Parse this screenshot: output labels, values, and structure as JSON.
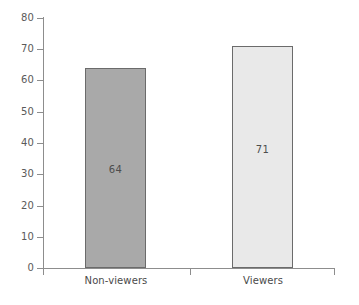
{
  "chart_data": {
    "type": "bar",
    "title": "",
    "subtitle": "",
    "xlabel": "",
    "ylabel": "",
    "categories": [
      "Non-viewers",
      "Viewers"
    ],
    "values": [
      64,
      71
    ],
    "value_labels": [
      "64",
      "71"
    ],
    "series": [
      {
        "name": "",
        "values": [
          64,
          71
        ]
      }
    ],
    "ylim": [
      0,
      80
    ],
    "y_ticks": [
      0,
      10,
      20,
      30,
      40,
      50,
      60,
      70,
      80
    ],
    "y_tick_labels": [
      "0",
      "10",
      "20",
      "30",
      "40",
      "50",
      "60",
      "70",
      "80"
    ],
    "grid": false,
    "legend": false,
    "legend_position": "none",
    "annotations": [],
    "bar_colors": [
      "#a9a9a9",
      "#e9e9e9"
    ],
    "bar_border_color": "#6b6b6b",
    "axis_color": "#8d8d8d",
    "text_color": "#525252",
    "background_color": "#ffffff"
  },
  "axis": {
    "y_labels": {
      "t80": "80",
      "t70": "70",
      "t60": "60",
      "t50": "50",
      "t40": "40",
      "t30": "30",
      "t20": "20",
      "t10": "10",
      "t0": "0"
    }
  },
  "bars": {
    "non_viewers": {
      "category": "Non-viewers",
      "value_label": "64"
    },
    "viewers": {
      "category": "Viewers",
      "value_label": "71"
    }
  }
}
